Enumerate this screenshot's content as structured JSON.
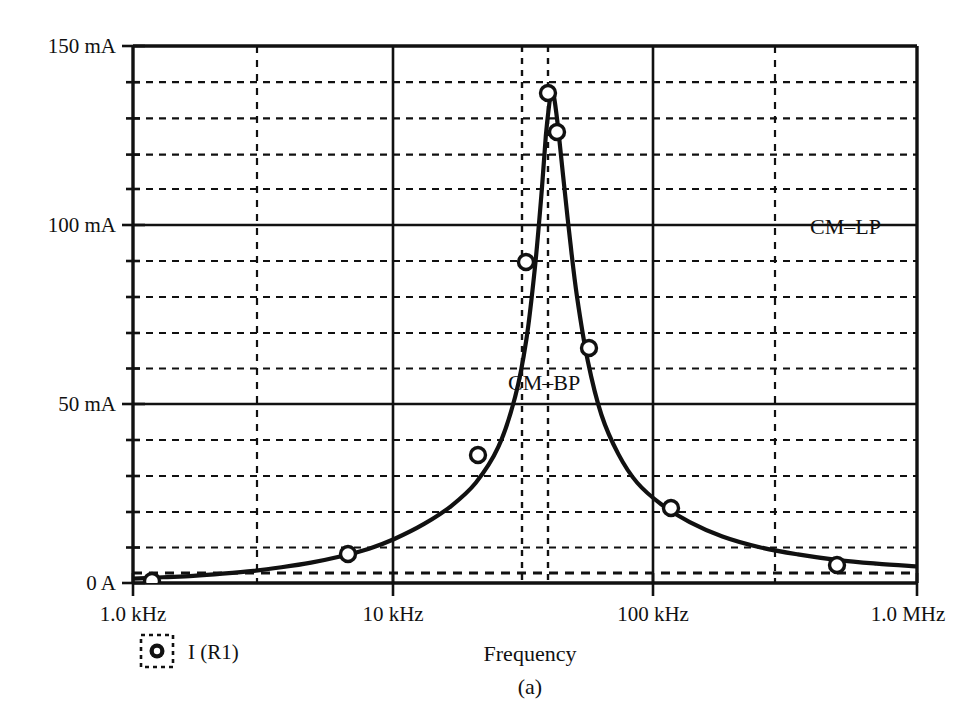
{
  "figure": {
    "caption": "(a)",
    "legend": {
      "marker_icon": "circle-marker-icon",
      "label": "I (R1)"
    },
    "annotations": [
      {
        "name": "cm-bp-label",
        "text": "CM–BP",
        "x": 508,
        "y": 390
      },
      {
        "name": "cm-lp-label",
        "text": "CM–LP",
        "x": 810,
        "y": 234
      }
    ]
  },
  "chart_data": {
    "type": "line",
    "title": "",
    "subtitle": "",
    "xlabel": "Frequency",
    "ylabel": "",
    "xscale": "log",
    "yscale": "linear",
    "xlim": [
      1000,
      1000000
    ],
    "ylim": [
      0,
      150
    ],
    "yunit": "mA",
    "grid": true,
    "grid_style": "dashed-minor-solid-major",
    "legend_position": "below-left",
    "xtick_labels": [
      "1.0 kHz",
      "10 kHz",
      "100 kHz",
      "1.0 MHz"
    ],
    "xtick_values": [
      1000,
      10000,
      100000,
      1000000
    ],
    "ytick_labels": [
      "0 A",
      "50 mA",
      "100 mA",
      "150 mA"
    ],
    "ytick_values": [
      0,
      50,
      100,
      150
    ],
    "y_minor_step": 10,
    "cursor_lines": [
      31600,
      39800
    ],
    "series": [
      {
        "name": "I (R1)",
        "color": "#111111",
        "marker": "open-circle",
        "x": [
          1000,
          1300,
          1700,
          2200,
          2900,
          3700,
          4800,
          6200,
          8000,
          10000,
          13000,
          16500,
          20500,
          25000,
          29000,
          32000,
          34500,
          36500,
          38000,
          39200,
          40000,
          41000,
          42500,
          44500,
          47000,
          50000,
          55000,
          62000,
          72000,
          85000,
          105000,
          135000,
          180000,
          250000,
          350000,
          500000,
          700000,
          1000000
        ],
        "y": [
          1.2,
          1.6,
          2.0,
          2.6,
          3.4,
          4.4,
          5.7,
          7.4,
          9.6,
          12.3,
          16.5,
          21.5,
          28.0,
          38.0,
          52.0,
          68.0,
          88.0,
          108.0,
          125.0,
          134.0,
          138.0,
          135.0,
          126.0,
          112.0,
          96.0,
          80.0,
          62.0,
          47.0,
          36.0,
          28.0,
          22.0,
          17.0,
          13.0,
          10.0,
          8.0,
          6.4,
          5.4,
          4.6
        ],
        "markers": [
          {
            "x": 1000,
            "y": 1.2,
            "px": 152,
            "py": 581
          },
          {
            "x": 6800,
            "y": 8.0,
            "px": 348,
            "py": 554
          },
          {
            "x": 21000,
            "y": 37.0,
            "px": 478,
            "py": 455
          },
          {
            "x": 31000,
            "y": 92.0,
            "px": 526,
            "py": 262
          },
          {
            "x": 40000,
            "y": 138.0,
            "px": 548,
            "py": 93
          },
          {
            "x": 44000,
            "y": 125.0,
            "px": 557,
            "py": 132
          },
          {
            "x": 52000,
            "y": 66.0,
            "px": 589,
            "py": 348
          },
          {
            "x": 110000,
            "y": 22.0,
            "px": 671,
            "py": 508
          },
          {
            "x": 700000,
            "y": 5.4,
            "px": 837,
            "py": 565
          }
        ]
      }
    ],
    "peak": {
      "x": 40000,
      "y": 138,
      "unit": "mA"
    }
  }
}
